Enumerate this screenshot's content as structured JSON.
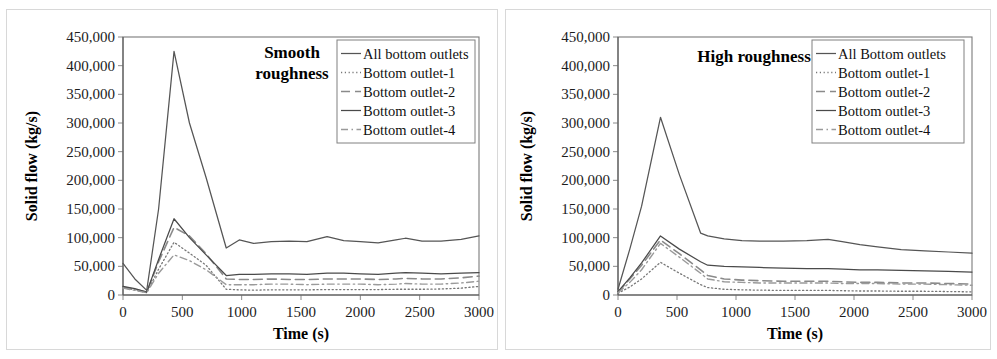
{
  "figure": {
    "panels": [
      {
        "id": "smooth",
        "title": "Smooth\nroughness",
        "title_lines": [
          "Smooth",
          "roughness"
        ],
        "legend_labels": [
          "All bottom outlets",
          "Bottom outlet-1",
          "Bottom outlet-2",
          "Bottom outlet-3",
          "Bottom outlet-4"
        ]
      },
      {
        "id": "high",
        "title": "High roughness",
        "title_lines": [
          "High roughness"
        ],
        "legend_labels": [
          "All Bottom outlets",
          "Bottom outlet-1",
          "Bottom outlet-2",
          "Bottom outlet-3",
          "Bottom outlet-4"
        ]
      }
    ]
  },
  "axes": {
    "xlabel": "Time (s)",
    "ylabel": "Solid flow (kg/s)",
    "xticks": [
      "0",
      "500",
      "1000",
      "1500",
      "2000",
      "2500",
      "3000"
    ],
    "yticks": [
      "0",
      "50,000",
      "100,000",
      "150,000",
      "200,000",
      "250,000",
      "300,000",
      "350,000",
      "400,000",
      "450,000"
    ],
    "xlim": [
      0,
      3000
    ],
    "ylim": [
      0,
      450000
    ]
  },
  "style": {
    "line_color_total": "#555555",
    "line_color_o1": "#777777",
    "line_color_o2": "#8a8a8a",
    "line_color_o3": "#4a4a4a",
    "line_color_o4": "#9a9a9a",
    "axis_color": "#595959",
    "frame_color": "#7a7a7a",
    "panel_border": "#d8d8d8"
  },
  "chart_data": [
    {
      "type": "line",
      "title": "Smooth roughness",
      "xlabel": "Time (s)",
      "ylabel": "Solid flow (kg/s)",
      "xlim": [
        0,
        3000
      ],
      "ylim": [
        0,
        450000
      ],
      "grid": false,
      "legend_position": "top-right",
      "x": [
        0,
        100,
        200,
        300,
        430,
        560,
        700,
        870,
        980,
        1100,
        1250,
        1400,
        1550,
        1720,
        1860,
        2000,
        2150,
        2300,
        2380,
        2520,
        2680,
        2850,
        3000
      ],
      "series": [
        {
          "name": "All bottom outlets",
          "style": "solid",
          "values": [
            55000,
            28000,
            8000,
            150000,
            425000,
            300000,
            205000,
            82000,
            96000,
            90000,
            93000,
            94000,
            93000,
            102000,
            95000,
            93000,
            91000,
            96000,
            99000,
            94000,
            94000,
            97000,
            103000
          ]
        },
        {
          "name": "Bottom outlet-1",
          "style": "dotted",
          "values": [
            13000,
            9000,
            4000,
            45000,
            92000,
            73000,
            52000,
            10000,
            9000,
            8500,
            9000,
            9000,
            9000,
            9500,
            9500,
            9500,
            9500,
            10000,
            10000,
            10000,
            10500,
            12000,
            15000
          ]
        },
        {
          "name": "Bottom outlet-2",
          "style": "longdash",
          "values": [
            14000,
            10000,
            5000,
            58000,
            118000,
            103000,
            72000,
            28000,
            27000,
            27000,
            28000,
            27000,
            27000,
            28000,
            28000,
            28000,
            27000,
            28000,
            29000,
            28000,
            28000,
            30000,
            33000
          ]
        },
        {
          "name": "Bottom outlet-3",
          "style": "solid",
          "values": [
            15000,
            11000,
            5000,
            62000,
            133000,
            100000,
            70000,
            34000,
            36000,
            36000,
            37000,
            37000,
            36000,
            38000,
            38000,
            37000,
            36000,
            38000,
            39000,
            38000,
            37000,
            38000,
            39000
          ]
        },
        {
          "name": "Bottom outlet-4",
          "style": "dashdot",
          "values": [
            12000,
            8000,
            4000,
            38000,
            70000,
            60000,
            44000,
            18000,
            18000,
            18000,
            19000,
            19000,
            18000,
            19000,
            19000,
            19000,
            18000,
            19000,
            20000,
            19000,
            19000,
            21000,
            24000
          ]
        }
      ]
    },
    {
      "type": "line",
      "title": "High roughness",
      "xlabel": "Time (s)",
      "ylabel": "Solid flow (kg/s)",
      "xlim": [
        0,
        3000
      ],
      "ylim": [
        0,
        450000
      ],
      "grid": false,
      "legend_position": "top-right",
      "x": [
        0,
        100,
        200,
        360,
        520,
        700,
        760,
        900,
        1050,
        1200,
        1400,
        1600,
        1780,
        1900,
        2050,
        2200,
        2400,
        2600,
        2800,
        3000
      ],
      "series": [
        {
          "name": "All Bottom outlets",
          "style": "solid",
          "values": [
            10000,
            80000,
            155000,
            310000,
            210000,
            108000,
            103000,
            98000,
            95000,
            94000,
            94000,
            95000,
            97000,
            93000,
            88000,
            84000,
            79000,
            77000,
            75000,
            73000
          ]
        },
        {
          "name": "Bottom outlet-1",
          "style": "dotted",
          "values": [
            3000,
            14000,
            28000,
            57000,
            38000,
            18000,
            13000,
            10000,
            9000,
            8500,
            8000,
            8000,
            8000,
            7500,
            7000,
            7000,
            6500,
            6500,
            6000,
            5500
          ]
        },
        {
          "name": "Bottom outlet-2",
          "style": "longdash",
          "values": [
            5000,
            28000,
            52000,
            96000,
            72000,
            44000,
            34000,
            28000,
            26000,
            25000,
            24000,
            24000,
            24000,
            23000,
            22000,
            22000,
            21000,
            21000,
            20000,
            19000
          ]
        },
        {
          "name": "Bottom outlet-3",
          "style": "solid",
          "values": [
            6000,
            30000,
            56000,
            103000,
            80000,
            58000,
            52000,
            50000,
            49000,
            48000,
            47000,
            46000,
            46000,
            45000,
            44000,
            44000,
            43000,
            42000,
            41000,
            40000
          ]
        },
        {
          "name": "Bottom outlet-4",
          "style": "dashdot",
          "values": [
            4000,
            22000,
            44000,
            90000,
            66000,
            38000,
            28000,
            23000,
            22000,
            21000,
            21000,
            21000,
            21000,
            20000,
            20000,
            20000,
            19000,
            19000,
            18000,
            17000
          ]
        }
      ]
    }
  ]
}
